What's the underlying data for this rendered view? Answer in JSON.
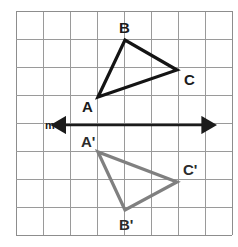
{
  "figure": {
    "canvas": {
      "width": 238,
      "height": 247,
      "background": "#ffffff"
    },
    "grid": {
      "x0": 16,
      "y0": 11,
      "cols": 8,
      "rows": 8,
      "cell_width": 27,
      "cell_height": 28,
      "line_color": "#9a9a9a",
      "line_width": 1,
      "border_color": "#8d8d8d"
    },
    "line_of_reflection": {
      "name": "m",
      "label": "m",
      "label_x": 50,
      "label_y": 129,
      "y": 125,
      "x_start": 66,
      "x_end": 204,
      "color": "#1b1b1b",
      "stroke_width": 2.6,
      "arrow_both_ends": true
    },
    "triangles": [
      {
        "id": "ABC",
        "color": "#141414",
        "stroke_width": 3.2,
        "vertices": [
          {
            "name": "A",
            "label": "A",
            "x": 98,
            "y": 97,
            "label_x": 82,
            "label_y": 112
          },
          {
            "name": "B",
            "label": "B",
            "x": 125,
            "y": 40,
            "label_x": 119,
            "label_y": 33
          },
          {
            "name": "C",
            "label": "C",
            "x": 177,
            "y": 70,
            "label_x": 184,
            "label_y": 85
          }
        ]
      },
      {
        "id": "A'B'C'",
        "color": "#808080",
        "stroke_width": 3.2,
        "vertices": [
          {
            "name": "A-prime",
            "label": "A'",
            "x": 98,
            "y": 152,
            "label_x": 81,
            "label_y": 147
          },
          {
            "name": "B-prime",
            "label": "B'",
            "x": 125,
            "y": 210,
            "label_x": 119,
            "label_y": 230
          },
          {
            "name": "C-prime",
            "label": "C'",
            "x": 177,
            "y": 182,
            "label_x": 183,
            "label_y": 175
          }
        ]
      }
    ]
  }
}
